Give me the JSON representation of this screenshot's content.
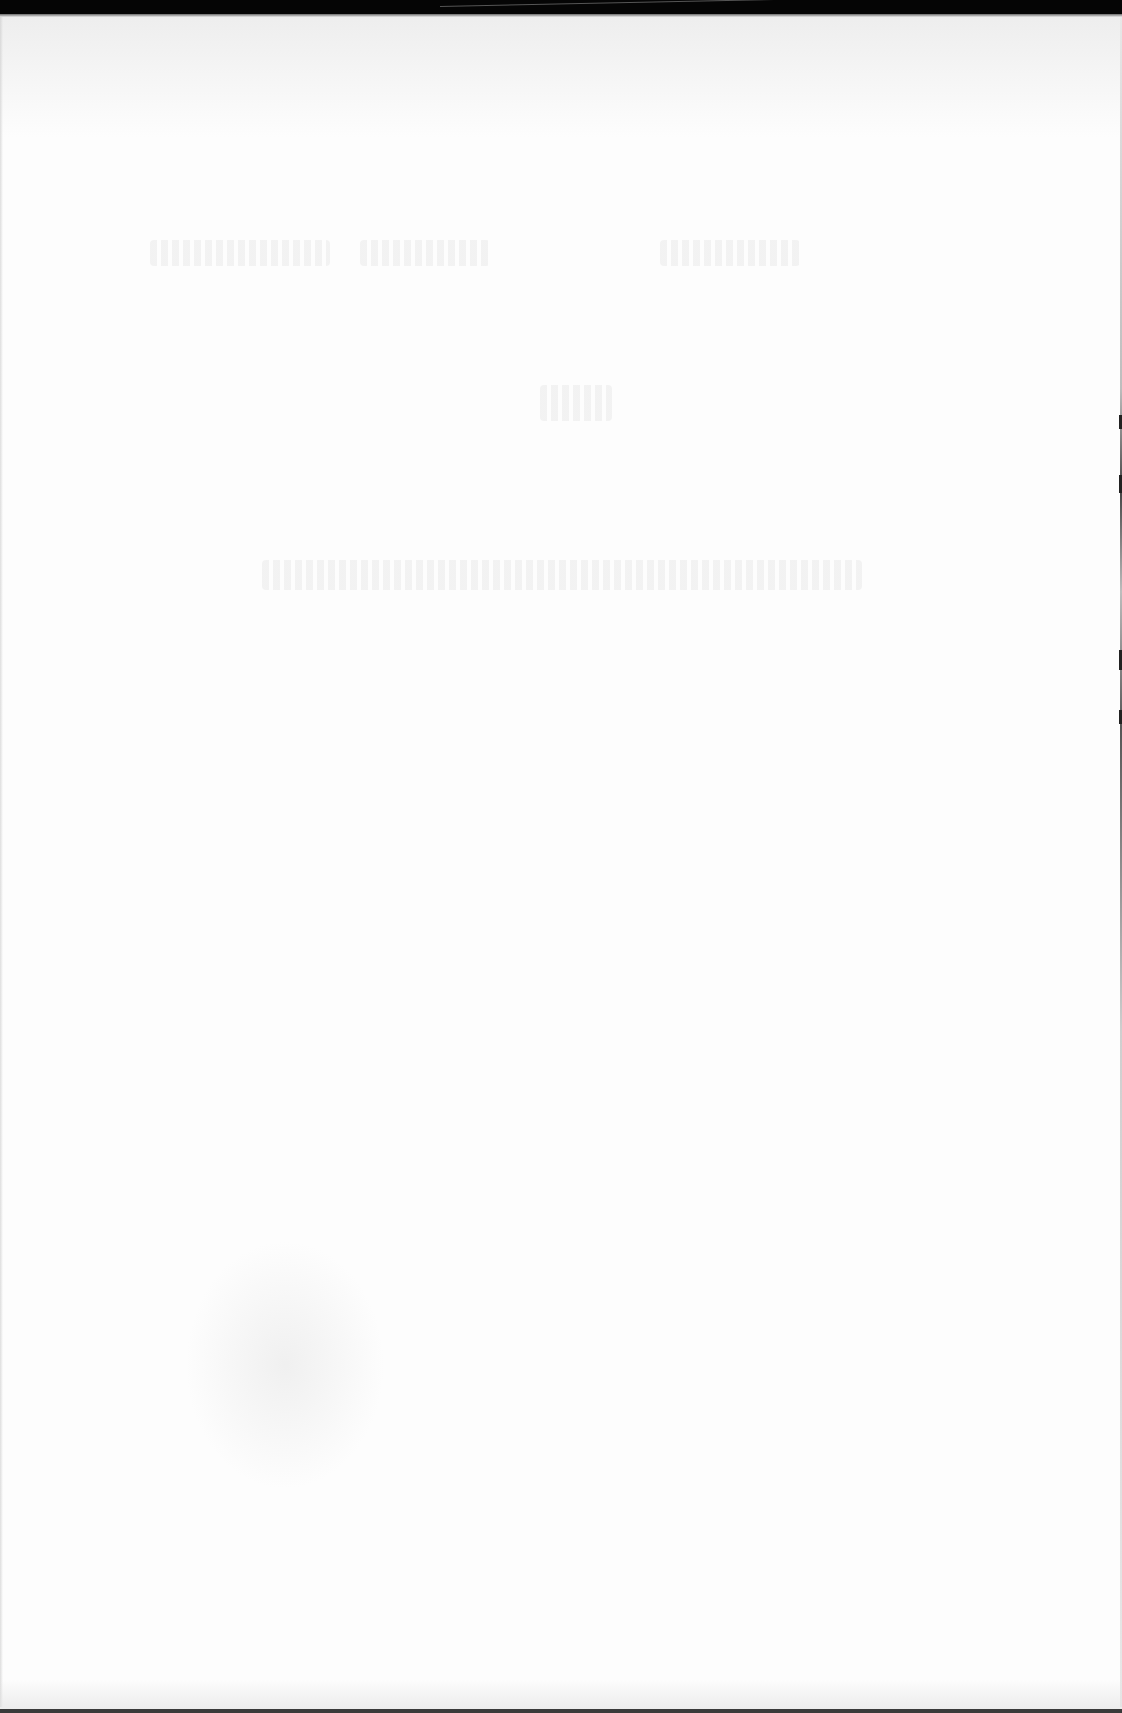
{
  "document": {
    "type": "scanned-page",
    "legible_text": [],
    "note_visible": "",
    "appearance": {
      "background": "#fdfdfd",
      "top_border": "#050505",
      "bottom_border": "#3a3a3a",
      "show_through": "#cdcdcd"
    },
    "show_through_regions": [
      {
        "name": "ghost-line-1",
        "x": 150,
        "y": 240,
        "w": 180,
        "h": 26
      },
      {
        "name": "ghost-line-2",
        "x": 360,
        "y": 240,
        "w": 130,
        "h": 26
      },
      {
        "name": "ghost-line-3",
        "x": 660,
        "y": 240,
        "w": 140,
        "h": 26
      },
      {
        "name": "ghost-heading",
        "x": 540,
        "y": 385,
        "w": 72,
        "h": 36
      },
      {
        "name": "ghost-title-line",
        "x": 262,
        "y": 560,
        "w": 600,
        "h": 30
      }
    ]
  }
}
